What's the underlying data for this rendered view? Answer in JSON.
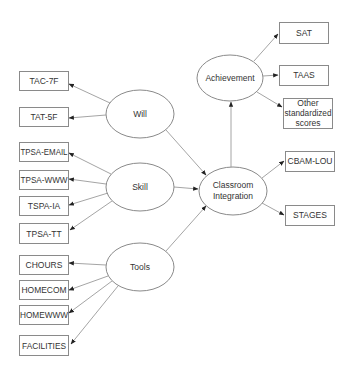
{
  "diagram": {
    "type": "path-model",
    "latent_nodes": [
      {
        "id": "will",
        "label": "Will",
        "cx": 140,
        "cy": 114,
        "rx": 34,
        "ry": 24
      },
      {
        "id": "skill",
        "label": "Skill",
        "cx": 140,
        "cy": 187,
        "rx": 34,
        "ry": 24
      },
      {
        "id": "tools",
        "label": "Tools",
        "cx": 140,
        "cy": 267,
        "rx": 34,
        "ry": 24
      },
      {
        "id": "achievement",
        "label": "Achievement",
        "cx": 230,
        "cy": 78,
        "rx": 33,
        "ry": 23
      },
      {
        "id": "classroom",
        "label_line1": "Classroom",
        "label_line2": "Integration",
        "cx": 233,
        "cy": 191,
        "rx": 34,
        "ry": 24
      }
    ],
    "observed_nodes": [
      {
        "id": "tac7f",
        "label": "TAC-7F",
        "x": 19,
        "y": 71,
        "w": 49,
        "h": 19
      },
      {
        "id": "tat5f",
        "label": "TAT-5F",
        "x": 19,
        "y": 107,
        "w": 49,
        "h": 19
      },
      {
        "id": "tpsaemail",
        "label": "TPSA-EMAIL",
        "x": 19,
        "y": 142,
        "w": 49,
        "h": 19
      },
      {
        "id": "tpsawww",
        "label": "TPSA-WWW",
        "x": 19,
        "y": 170,
        "w": 49,
        "h": 19
      },
      {
        "id": "tspaia",
        "label": "TSPA-IA",
        "x": 19,
        "y": 196,
        "w": 49,
        "h": 19
      },
      {
        "id": "tpsatt",
        "label": "TPSA-TT",
        "x": 19,
        "y": 223,
        "w": 49,
        "h": 20
      },
      {
        "id": "chours",
        "label": "CHOURS",
        "x": 19,
        "y": 255,
        "w": 49,
        "h": 19
      },
      {
        "id": "homecom",
        "label": "HOMECOM",
        "x": 19,
        "y": 280,
        "w": 49,
        "h": 19
      },
      {
        "id": "homewww",
        "label": "HOMEWWW",
        "x": 19,
        "y": 305,
        "w": 49,
        "h": 19
      },
      {
        "id": "facilities",
        "label": "FACILITIES",
        "x": 19,
        "y": 335,
        "w": 49,
        "h": 20
      },
      {
        "id": "sat",
        "label": "SAT",
        "x": 279,
        "y": 22,
        "w": 49,
        "h": 21
      },
      {
        "id": "taas",
        "label": "TAAS",
        "x": 279,
        "y": 65,
        "w": 49,
        "h": 20
      },
      {
        "id": "other",
        "label_line1": "Other",
        "label_line2": "standardized",
        "label_line3": "scores",
        "x": 283,
        "y": 98,
        "w": 49,
        "h": 30
      },
      {
        "id": "cbamlou",
        "label": "CBAM-LOU",
        "x": 285,
        "y": 151,
        "w": 49,
        "h": 20
      },
      {
        "id": "stages",
        "label": "STAGES",
        "x": 285,
        "y": 205,
        "w": 49,
        "h": 20
      }
    ],
    "edges": [
      {
        "from": "will",
        "to": "tac7f"
      },
      {
        "from": "will",
        "to": "tat5f"
      },
      {
        "from": "skill",
        "to": "tpsaemail"
      },
      {
        "from": "skill",
        "to": "tpsawww"
      },
      {
        "from": "skill",
        "to": "tspaia"
      },
      {
        "from": "skill",
        "to": "tpsatt"
      },
      {
        "from": "tools",
        "to": "chours"
      },
      {
        "from": "tools",
        "to": "homecom"
      },
      {
        "from": "tools",
        "to": "homewww"
      },
      {
        "from": "tools",
        "to": "facilities"
      },
      {
        "from": "will",
        "to": "classroom"
      },
      {
        "from": "skill",
        "to": "classroom"
      },
      {
        "from": "tools",
        "to": "classroom"
      },
      {
        "from": "classroom",
        "to": "achievement"
      },
      {
        "from": "classroom",
        "to": "cbamlou"
      },
      {
        "from": "classroom",
        "to": "stages"
      },
      {
        "from": "achievement",
        "to": "sat"
      },
      {
        "from": "achievement",
        "to": "taas"
      },
      {
        "from": "achievement",
        "to": "other"
      }
    ],
    "colors": {
      "stroke": "#8a8a8a",
      "edge": "#9a9a9a",
      "text": "#333333",
      "background": "#ffffff"
    }
  }
}
